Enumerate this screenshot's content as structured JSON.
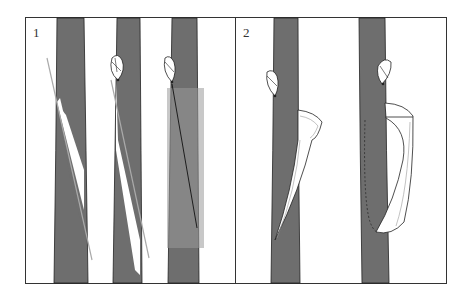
{
  "figure": {
    "panels": [
      {
        "id": "panel-1",
        "label": "1"
      },
      {
        "id": "panel-2",
        "label": "2"
      }
    ]
  },
  "colors": {
    "stem": "#6e6e6e",
    "highlight": "#b8b8b8",
    "outline": "#222222",
    "background": "#ffffff"
  }
}
